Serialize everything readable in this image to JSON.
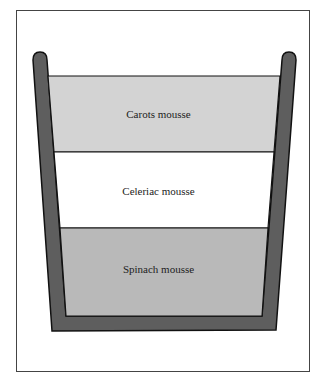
{
  "diagram": {
    "type": "layered-container",
    "layers": [
      {
        "label": "Carots mousse",
        "color": "#d3d3d3"
      },
      {
        "label": "Celeriac mousse",
        "color": "#ffffff"
      },
      {
        "label": "Spinach mousse",
        "color": "#b9b9b9"
      }
    ],
    "container_color": "#5e5e5e",
    "outline_color": "#111111"
  }
}
